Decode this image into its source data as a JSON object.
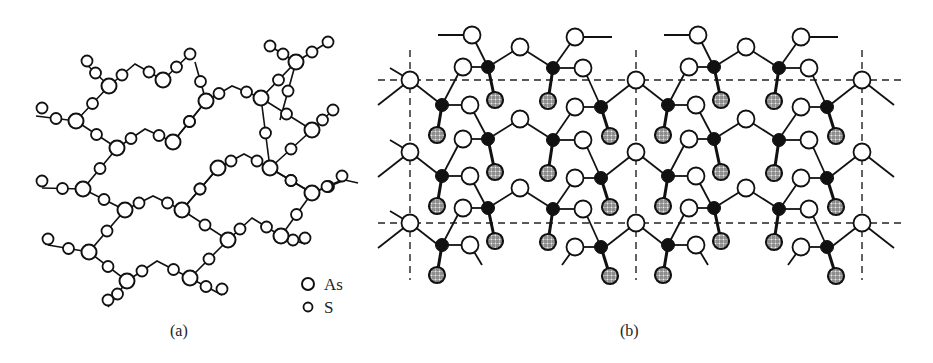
{
  "figure": {
    "panel_a": {
      "label": "(a)",
      "legend": [
        {
          "symbol": "large-open-circle",
          "text": "As"
        },
        {
          "symbol": "small-open-circle",
          "text": "S"
        }
      ],
      "chains": [
        [
          [
            42,
            115
          ],
          [
            76,
            121
          ],
          [
            109,
            86
          ],
          [
            135,
            70
          ],
          [
            167,
            82
          ],
          [
            191,
            71
          ]
        ],
        [
          [
            84,
            110
          ],
          [
            93,
            97
          ],
          [
            109,
            86
          ]
        ],
        [
          [
            81,
            102
          ],
          [
            109,
            86
          ]
        ],
        [
          [
            36,
            117
          ],
          [
            45,
            106
          ],
          [
            76,
            121
          ],
          [
            95,
            127
          ],
          [
            117,
            148
          ],
          [
            144,
            130
          ],
          [
            173,
            142
          ],
          [
            194,
            154
          ],
          [
            219,
            136
          ]
        ],
        [
          [
            122,
            70
          ],
          [
            135,
            70
          ]
        ],
        [
          [
            75,
            60
          ],
          [
            88,
            61
          ],
          [
            109,
            86
          ]
        ],
        [
          [
            95,
            127
          ],
          [
            117,
            148
          ],
          [
            105,
            162
          ],
          [
            83,
            189
          ],
          [
            101,
            193
          ],
          [
            125,
            210
          ],
          [
            153,
            197
          ],
          [
            182,
            210
          ],
          [
            206,
            222
          ],
          [
            225,
            218
          ],
          [
            247,
            208
          ],
          [
            268,
            219
          ],
          [
            286,
            218
          ],
          [
            301,
            203
          ],
          [
            316,
            192
          ],
          [
            328,
            179
          ],
          [
            360,
            182
          ]
        ],
        [
          [
            173,
            142
          ],
          [
            182,
            210
          ]
        ],
        [
          [
            206,
            222
          ],
          [
            215,
            218
          ],
          [
            228,
            241
          ],
          [
            249,
            225
          ],
          [
            280,
            241
          ]
        ],
        [
          [
            40,
            188
          ],
          [
            53,
            181
          ],
          [
            83,
            189
          ]
        ],
        [
          [
            46,
            245
          ],
          [
            59,
            240
          ],
          [
            89,
            252
          ],
          [
            108,
            258
          ],
          [
            127,
            281
          ],
          [
            157,
            261
          ],
          [
            190,
            278
          ],
          [
            201,
            286
          ],
          [
            222,
            294
          ]
        ],
        [
          [
            228,
            241
          ],
          [
            210,
            250
          ],
          [
            190,
            278
          ]
        ],
        [
          [
            127,
            281
          ],
          [
            118,
            295
          ],
          [
            108,
            307
          ]
        ]
      ],
      "as_atoms": [
        [
          76,
          121
        ],
        [
          109,
          86
        ],
        [
          163,
          82
        ],
        [
          117,
          148
        ],
        [
          173,
          142
        ],
        [
          206,
          101
        ],
        [
          261,
          98
        ],
        [
          305,
          62
        ],
        [
          83,
          189
        ],
        [
          125,
          210
        ],
        [
          182,
          210
        ],
        [
          218,
          171
        ],
        [
          270,
          168
        ],
        [
          313,
          193
        ],
        [
          89,
          252
        ],
        [
          127,
          281
        ],
        [
          190,
          278
        ],
        [
          228,
          241
        ],
        [
          281,
          236
        ]
      ],
      "s_atoms": [
        [
          42,
          108
        ],
        [
          88,
          61
        ],
        [
          135,
          62
        ],
        [
          187,
          54
        ],
        [
          95,
          127
        ],
        [
          99,
          96
        ],
        [
          142,
          129
        ],
        [
          182,
          78
        ],
        [
          194,
          154
        ],
        [
          232,
          89
        ],
        [
          283,
          78
        ],
        [
          275,
          105
        ],
        [
          328,
          54
        ],
        [
          331,
          108
        ],
        [
          144,
          130
        ],
        [
          151,
          150
        ],
        [
          105,
          162
        ],
        [
          202,
          185
        ],
        [
          204,
          122
        ],
        [
          224,
          153
        ],
        [
          243,
          154
        ],
        [
          272,
          196
        ],
        [
          305,
          174
        ],
        [
          293,
          141
        ],
        [
          333,
          111
        ],
        [
          53,
          181
        ],
        [
          101,
          193
        ],
        [
          153,
          197
        ],
        [
          199,
          218
        ],
        [
          248,
          218
        ],
        [
          268,
          219
        ],
        [
          301,
          210
        ],
        [
          299,
          241
        ],
        [
          329,
          175
        ],
        [
          59,
          240
        ],
        [
          108,
          258
        ],
        [
          157,
          261
        ],
        [
          210,
          250
        ],
        [
          202,
          278
        ],
        [
          210,
          285
        ],
        [
          100,
          298
        ]
      ]
    },
    "panel_b": {
      "label": "(b)",
      "colors": {
        "bond": "#111111",
        "black_atom": "#111111",
        "white_atom": "#ffffff",
        "hatched_atom_bg": "#e6e6e6"
      },
      "unit_cell": {
        "x_lines": [
          410,
          636,
          862
        ],
        "y_lines": [
          80,
          223
        ],
        "x_range": [
          378,
          905
        ],
        "y_range": [
          45,
          280
        ]
      }
    }
  }
}
